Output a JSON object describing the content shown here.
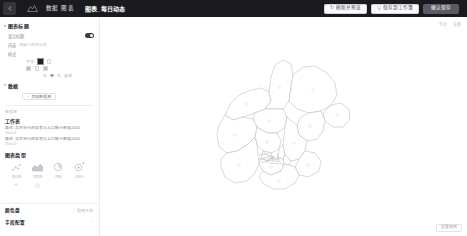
{
  "header": {
    "back_icon": "chevron-left-icon",
    "logo_icon": "app-logo-icon",
    "menu": [
      "数据",
      "图表"
    ],
    "title": "图表_每日动态",
    "buttons": [
      {
        "icon": "refresh-icon",
        "label": "刷新并预览"
      },
      {
        "icon": "save-icon",
        "label": "保存到工作簿"
      },
      {
        "label": "确认保存",
        "primary": true
      }
    ]
  },
  "sidebar": {
    "sections": [
      {
        "name": "chart-title-section",
        "title": "图表标题",
        "caret": "▾",
        "rows": [
          {
            "type": "toggle",
            "label": "显示标题",
            "on": true
          },
          {
            "type": "text",
            "label": "内容",
            "hint": "请输入图表标题"
          },
          {
            "type": "swatch",
            "label": "样式",
            "sub_label": "字体",
            "swatches": [
              "light",
              "dark",
              "mid",
              "light"
            ],
            "selected": 1
          },
          {
            "type": "segment",
            "items": [
              "左",
              "中",
              "右",
              "自动"
            ],
            "selected": 1
          }
        ]
      },
      {
        "name": "data-source-section",
        "title": "数据",
        "caret": "▾",
        "chip": {
          "icon": "plus-icon",
          "label": "添加数据源"
        },
        "small_label": "数据源",
        "block_title": "工作表",
        "paths": [
          {
            "line": "路径:  北京市行政区划与人口统计数据2024",
            "sub": "Sheet1"
          },
          {
            "line": "路径:  北京市行政区划与人口统计数据2024",
            "sub": "Sheet2"
          }
        ]
      },
      {
        "name": "chart-type-section",
        "title": "图表类型",
        "icons": [
          {
            "name": "scatter-chart-icon",
            "caption": "散点图"
          },
          {
            "name": "area-chart-icon",
            "caption": "面积图"
          },
          {
            "name": "pie-chart-icon",
            "caption": "饼图"
          },
          {
            "name": "custom-chart-icon",
            "caption": "自定义"
          }
        ],
        "icons2": [
          {
            "name": "add-chart-icon"
          },
          {
            "name": "more-chart-icon"
          }
        ]
      }
    ],
    "footer_sections": [
      {
        "name": "color-theme-section",
        "title": "颜色盘",
        "value": "跟随主题",
        "caret": "›"
      },
      {
        "name": "field-config-section",
        "title": "字段配置",
        "value": "",
        "caret": "›"
      }
    ]
  },
  "canvas": {
    "tools": [
      "导出",
      "设置"
    ],
    "footer_button": "重置视图",
    "map": {
      "name": "beijing-districts-map",
      "districts": [
        "延庆区",
        "怀柔区",
        "密云区",
        "昌平区",
        "平谷区",
        "顺义区",
        "门头沟区",
        "海淀区",
        "朝阳区",
        "石景山区",
        "西城区",
        "东城区",
        "丰台区",
        "通州区",
        "房山区",
        "大兴区"
      ]
    }
  }
}
